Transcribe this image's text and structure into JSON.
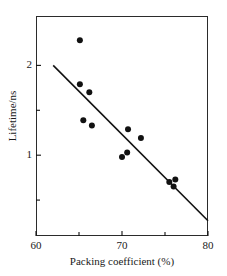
{
  "figure": {
    "top_caption": "",
    "background_color": "#ffffff",
    "frame_color": "#2b2b2b"
  },
  "chart_data": {
    "type": "scatter",
    "title": "",
    "xlabel": "Packing coefficient (%)",
    "ylabel": "Lifetime/ns",
    "xlim": [
      60,
      80
    ],
    "ylim": [
      0.1,
      2.55
    ],
    "grid": false,
    "legend": null,
    "marker_color": "#111111",
    "marker_size_px": 6,
    "line_color": "#111111",
    "xticks": [
      60,
      70,
      80
    ],
    "xtick_labels": [
      "60",
      "70",
      "80"
    ],
    "x_minor_ticks": [
      65,
      75
    ],
    "yticks": [
      1,
      2
    ],
    "ytick_labels": [
      "1",
      "2"
    ],
    "y_minor_ticks": [
      0.5,
      1.5
    ],
    "points": [
      {
        "x": 65.1,
        "y": 2.28
      },
      {
        "x": 65.1,
        "y": 1.79
      },
      {
        "x": 66.2,
        "y": 1.7
      },
      {
        "x": 65.5,
        "y": 1.39
      },
      {
        "x": 66.5,
        "y": 1.33
      },
      {
        "x": 70.7,
        "y": 1.29
      },
      {
        "x": 72.2,
        "y": 1.19
      },
      {
        "x": 70.0,
        "y": 0.98
      },
      {
        "x": 70.6,
        "y": 1.03
      },
      {
        "x": 75.5,
        "y": 0.7
      },
      {
        "x": 76.2,
        "y": 0.73
      },
      {
        "x": 76.0,
        "y": 0.65
      }
    ],
    "fit_line": {
      "name": "linear fit",
      "x_start": 62.0,
      "y_start": 2.0,
      "x_end": 80.0,
      "y_end": 0.27
    }
  }
}
